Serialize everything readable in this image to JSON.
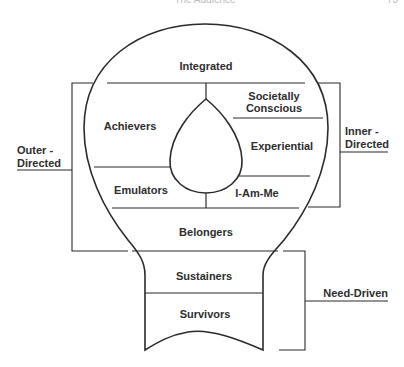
{
  "header": {
    "running_title": "The Audience",
    "page_number": "73"
  },
  "diagram": {
    "type": "VALS lifestyle typology (light-bulb diagram)",
    "segments": [
      {
        "id": "integrated",
        "label": "Integrated"
      },
      {
        "id": "achievers",
        "label": "Achievers"
      },
      {
        "id": "societally-conscious",
        "label_line1": "Societally",
        "label_line2": "Conscious"
      },
      {
        "id": "experiential",
        "label": "Experiential"
      },
      {
        "id": "emulators",
        "label": "Emulators"
      },
      {
        "id": "i-am-me",
        "label": "I-Am-Me"
      },
      {
        "id": "belongers",
        "label": "Belongers"
      },
      {
        "id": "sustainers",
        "label": "Sustainers"
      },
      {
        "id": "survivors",
        "label": "Survivors"
      }
    ],
    "groups": {
      "outer_directed": {
        "line1": "Outer -",
        "line2": "Directed"
      },
      "inner_directed": {
        "line1": "Inner -",
        "line2": "Directed"
      },
      "need_driven": {
        "label": "Need-Driven"
      }
    },
    "colors": {
      "line": "#2b2b2b",
      "text": "#2e2e2e",
      "background": "#ffffff"
    }
  }
}
